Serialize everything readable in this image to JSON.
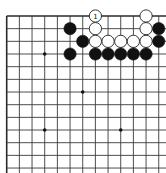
{
  "board": {
    "visible_cols": 13,
    "visible_rows": 13,
    "origin_x": 6.7,
    "origin_y": 16,
    "spacing": 12.67,
    "cropped_right": true,
    "cropped_bottom": true,
    "line_color": "#3a3a3a",
    "edge_color": "#2a2a2a",
    "star_points": [
      [
        3,
        3
      ],
      [
        6,
        6
      ],
      [
        3,
        9
      ],
      [
        9,
        9
      ],
      [
        9,
        3
      ]
    ],
    "black_color": "#111111",
    "white_fill": "#ffffff",
    "white_stroke": "#222222"
  },
  "stones": [
    {
      "color": "white",
      "col": 7,
      "row": 0,
      "label": "1"
    },
    {
      "color": "white",
      "col": 11,
      "row": 0,
      "label": ""
    },
    {
      "color": "black",
      "col": 5,
      "row": 1,
      "label": ""
    },
    {
      "color": "white",
      "col": 7,
      "row": 1,
      "label": ""
    },
    {
      "color": "white",
      "col": 11,
      "row": 1,
      "label": ""
    },
    {
      "color": "black",
      "col": 12,
      "row": 1,
      "label": ""
    },
    {
      "color": "black",
      "col": 6,
      "row": 2,
      "label": ""
    },
    {
      "color": "white",
      "col": 7,
      "row": 2,
      "label": ""
    },
    {
      "color": "white",
      "col": 8,
      "row": 2,
      "label": ""
    },
    {
      "color": "white",
      "col": 9,
      "row": 2,
      "label": ""
    },
    {
      "color": "white",
      "col": 10,
      "row": 2,
      "label": ""
    },
    {
      "color": "white",
      "col": 11,
      "row": 2,
      "label": ""
    },
    {
      "color": "black",
      "col": 12,
      "row": 2,
      "label": ""
    },
    {
      "color": "black",
      "col": 5,
      "row": 3,
      "label": ""
    },
    {
      "color": "black",
      "col": 7,
      "row": 3,
      "label": ""
    },
    {
      "color": "black",
      "col": 8,
      "row": 3,
      "label": ""
    },
    {
      "color": "black",
      "col": 9,
      "row": 3,
      "label": ""
    },
    {
      "color": "black",
      "col": 10,
      "row": 3,
      "label": ""
    },
    {
      "color": "black",
      "col": 11,
      "row": 3,
      "label": ""
    }
  ]
}
